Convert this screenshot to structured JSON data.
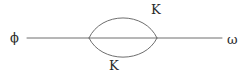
{
  "figure": {
    "kind": "feynman-diagram",
    "width": 249,
    "height": 77,
    "background_color": "#ffffff",
    "line_color": "#6e6e6e",
    "text_color": "#2b2b2b"
  },
  "labels": {
    "incoming": "ϕ",
    "outgoing": "ω",
    "loop_top": "K",
    "loop_bottom": "K"
  },
  "geometry": {
    "baseline_y": 38,
    "line_start_x": 27,
    "line_end_x": 222,
    "vertex_left_x": 89,
    "vertex_right_x": 157,
    "loop_top_y": 16,
    "loop_bottom_y": 59,
    "stroke_width": 1
  },
  "chart_data": {
    "type": "diagram",
    "title": "",
    "nodes": [
      {
        "id": "external-in",
        "label": "ϕ",
        "x": 14,
        "y": 38
      },
      {
        "id": "vertex-left",
        "label": "",
        "x": 89,
        "y": 38
      },
      {
        "id": "vertex-right",
        "label": "",
        "x": 157,
        "y": 38
      },
      {
        "id": "external-out",
        "label": "ω",
        "x": 232,
        "y": 38
      }
    ],
    "edges": [
      {
        "from": "external-in",
        "to": "vertex-left",
        "label": "",
        "style": "straight"
      },
      {
        "from": "vertex-left",
        "to": "vertex-right",
        "label": "",
        "style": "straight"
      },
      {
        "from": "vertex-left",
        "to": "vertex-right",
        "label": "K",
        "style": "arc-up"
      },
      {
        "from": "vertex-left",
        "to": "vertex-right",
        "label": "K",
        "style": "arc-down"
      },
      {
        "from": "vertex-right",
        "to": "external-out",
        "label": "",
        "style": "straight"
      }
    ]
  }
}
